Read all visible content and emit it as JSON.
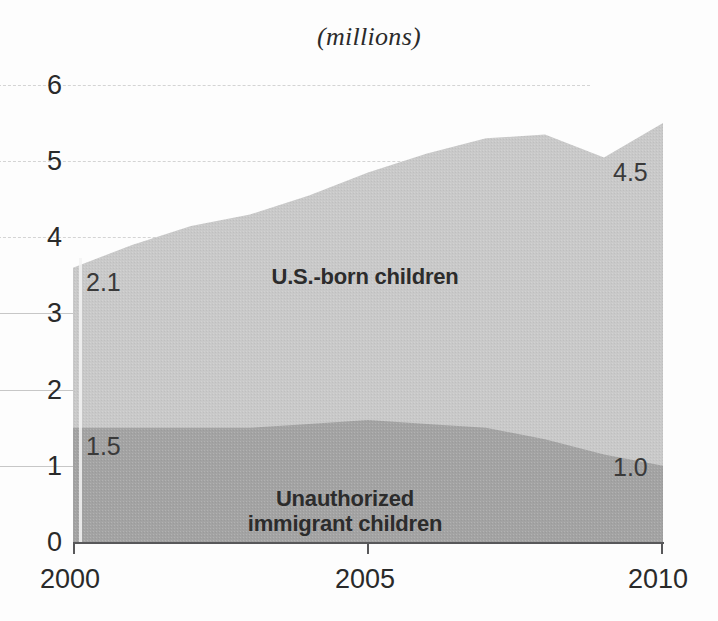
{
  "chart_data": {
    "type": "area",
    "title": "(millions)",
    "subtitle": "",
    "xlabel": "",
    "ylabel": "",
    "stacked": true,
    "grid": true,
    "legend_position": "inline",
    "xlim": [
      2000,
      2010
    ],
    "ylim": [
      0,
      6
    ],
    "yticks": [
      0,
      1,
      2,
      3,
      4,
      5,
      6
    ],
    "xticks": [
      2000,
      2005,
      2010
    ],
    "xtick_labels": [
      "2000",
      "2005",
      "2010"
    ],
    "ytick_labels": [
      "0",
      "1",
      "2",
      "3",
      "4",
      "5",
      "6"
    ],
    "x": [
      2000,
      2001,
      2002,
      2003,
      2004,
      2005,
      2006,
      2007,
      2008,
      2009,
      2010
    ],
    "series": [
      {
        "name": "Unauthorized immigrant children",
        "color": "#a3a3a3",
        "values": [
          1.5,
          1.5,
          1.5,
          1.5,
          1.55,
          1.6,
          1.55,
          1.5,
          1.35,
          1.15,
          1.0
        ]
      },
      {
        "name": "U.S.-born children",
        "color": "#c9c9c9",
        "values": [
          2.1,
          2.4,
          2.65,
          2.8,
          3.0,
          3.25,
          3.55,
          3.8,
          4.0,
          3.9,
          4.5
        ]
      }
    ],
    "totals": [
      3.6,
      3.9,
      4.15,
      4.3,
      4.55,
      4.85,
      5.1,
      5.3,
      5.35,
      5.05,
      5.5
    ],
    "annotations": [
      {
        "id": "usborn-start",
        "text": "2.1",
        "x": 2000,
        "value": 2.1
      },
      {
        "id": "usborn-end",
        "text": "4.5",
        "x": 2010,
        "value": 4.5
      },
      {
        "id": "unauth-start",
        "text": "1.5",
        "x": 2000,
        "value": 1.5
      },
      {
        "id": "unauth-end",
        "text": "1.0",
        "x": 2010,
        "value": 1.0
      }
    ]
  },
  "title": {
    "text": "(millions)"
  },
  "axes": {
    "y_labels": [
      "6",
      "5",
      "4",
      "3",
      "2",
      "1",
      "0"
    ],
    "x_labels": [
      "2000",
      "2005",
      "2010"
    ]
  },
  "series_labels": {
    "upper": "U.S.-born children",
    "lower_line1": "Unauthorized",
    "lower_line2": "immigrant children"
  },
  "value_labels": {
    "upper_start": "2.1",
    "upper_end": "4.5",
    "lower_start": "1.5",
    "lower_end": "1.0"
  },
  "colors": {
    "upper_area": "#c9c9c9",
    "lower_area": "#a3a3a3",
    "grid": "#9a9a9a",
    "axis": "#58585a",
    "text": "#2a2a2a",
    "background": "#fdfdfd"
  }
}
